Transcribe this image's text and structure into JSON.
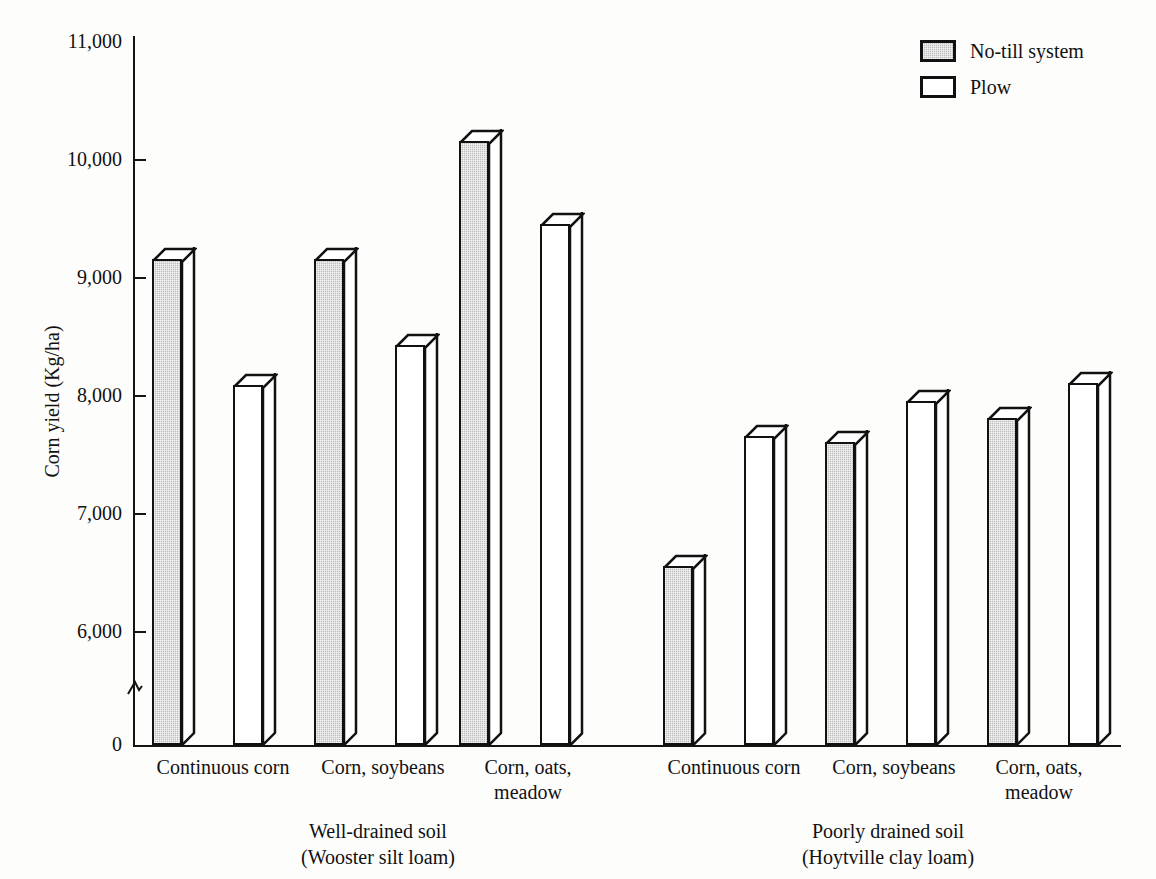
{
  "chart_data": {
    "type": "bar",
    "title": "",
    "xlabel": "",
    "ylabel": "Corn yield (Kg/ha)",
    "ylim": [
      0,
      11000
    ],
    "y_ticks": [
      "0",
      "6,000",
      "7,000",
      "8,000",
      "9,000",
      "10,000",
      "11,000"
    ],
    "y_tick_values": [
      0,
      6000,
      7000,
      8000,
      9000,
      10000,
      11000
    ],
    "axis_break": true,
    "axis_break_note": "y-axis broken between 0 and 6,000",
    "grid": false,
    "legend_position": "top-right",
    "categories": [
      "Continuous corn",
      "Corn, soybeans",
      "Corn, oats, meadow",
      "Continuous corn",
      "Corn, soybeans",
      "Corn, oats, meadow"
    ],
    "groups": [
      {
        "name": "Well-drained soil",
        "subtitle": "(Wooster silt loam)",
        "categories": [
          "Continuous corn",
          "Corn, soybeans",
          "Corn, oats, meadow"
        ]
      },
      {
        "name": "Poorly drained soil",
        "subtitle": "(Hoytville clay loam)",
        "categories": [
          "Continuous corn",
          "Corn, soybeans",
          "Corn, oats, meadow"
        ]
      }
    ],
    "series": [
      {
        "name": "No-till system",
        "color": "#bdbdbd",
        "values": [
          9450,
          9450,
          10450,
          6850,
          7900,
          8100
        ]
      },
      {
        "name": "Plow",
        "color": "#ffffff",
        "values": [
          8380,
          8720,
          9750,
          7950,
          8250,
          8400
        ]
      }
    ],
    "bars": [
      {
        "group": "Well-drained soil",
        "category": "Continuous corn",
        "series": "No-till system",
        "value": 9450,
        "x": 152
      },
      {
        "group": "Well-drained soil",
        "category": "Continuous corn",
        "series": "Plow",
        "value": 8380,
        "x": 233
      },
      {
        "group": "Well-drained soil",
        "category": "Corn, soybeans",
        "series": "No-till system",
        "value": 9450,
        "x": 314
      },
      {
        "group": "Well-drained soil",
        "category": "Corn, soybeans",
        "series": "Plow",
        "value": 8720,
        "x": 395
      },
      {
        "group": "Well-drained soil",
        "category": "Corn, oats, meadow",
        "series": "No-till system",
        "value": 10450,
        "x": 459
      },
      {
        "group": "Well-drained soil",
        "category": "Corn, oats, meadow",
        "series": "Plow",
        "value": 9750,
        "x": 540
      },
      {
        "group": "Poorly drained soil",
        "category": "Continuous corn",
        "series": "No-till system",
        "value": 6850,
        "x": 663
      },
      {
        "group": "Poorly drained soil",
        "category": "Continuous corn",
        "series": "Plow",
        "value": 7950,
        "x": 744
      },
      {
        "group": "Poorly drained soil",
        "category": "Corn, soybeans",
        "series": "No-till system",
        "value": 7900,
        "x": 825
      },
      {
        "group": "Poorly drained soil",
        "category": "Corn, soybeans",
        "series": "Plow",
        "value": 8250,
        "x": 906
      },
      {
        "group": "Poorly drained soil",
        "category": "Corn, oats, meadow",
        "series": "No-till system",
        "value": 8100,
        "x": 987
      },
      {
        "group": "Poorly drained soil",
        "category": "Corn, oats, meadow",
        "series": "Plow",
        "value": 8400,
        "x": 1068
      }
    ]
  },
  "axis": {
    "y_title": "Corn yield (Kg/ha)",
    "ticks": [
      {
        "label": "11,000",
        "value": 11000
      },
      {
        "label": "10,000",
        "value": 10000
      },
      {
        "label": "9,000",
        "value": 9000
      },
      {
        "label": "8,000",
        "value": 8000
      },
      {
        "label": "7,000",
        "value": 7000
      },
      {
        "label": "6,000",
        "value": 6000
      },
      {
        "label": "0",
        "value": 0
      }
    ]
  },
  "category_labels": [
    {
      "line1": "Continuous corn",
      "line2": ""
    },
    {
      "line1": "Corn, soybeans",
      "line2": ""
    },
    {
      "line1": "Corn, oats,",
      "line2": "meadow"
    },
    {
      "line1": "Continuous corn",
      "line2": ""
    },
    {
      "line1": "Corn, soybeans",
      "line2": ""
    },
    {
      "line1": "Corn, oats,",
      "line2": "meadow"
    }
  ],
  "group_labels": [
    {
      "line1": "Well-drained soil",
      "line2": "(Wooster silt loam)"
    },
    {
      "line1": "Poorly drained soil",
      "line2": "(Hoytville clay loam)"
    }
  ],
  "legend": {
    "items": [
      {
        "label": "No-till system",
        "swatch": "shaded"
      },
      {
        "label": "Plow",
        "swatch": "white"
      }
    ]
  }
}
